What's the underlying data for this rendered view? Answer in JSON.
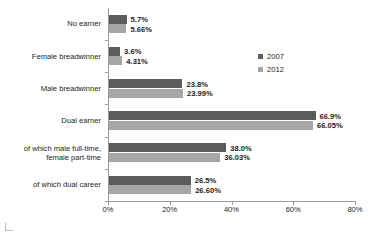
{
  "chart_data": {
    "type": "bar",
    "orientation": "horizontal",
    "title": "",
    "xlabel": "",
    "ylabel": "",
    "xlim": [
      0,
      80
    ],
    "xticks": [
      "0%",
      "20%",
      "40%",
      "60%",
      "80%"
    ],
    "xtick_values": [
      0,
      20,
      40,
      60,
      80
    ],
    "grid": false,
    "legend_position": "right",
    "categories": [
      "No earner",
      "Female breadwinner",
      "Male breadwinner",
      "Dual earner",
      "of which male full-time,\nfemale part-time",
      "of which dual career"
    ],
    "series": [
      {
        "name": "2007",
        "color": "#5c5c5c",
        "values": [
          5.7,
          3.6,
          23.8,
          66.9,
          38.0,
          26.5
        ],
        "labels": [
          "5.7%",
          "3.6%",
          "23.8%",
          "66.9%",
          "38.0%",
          "26.5%"
        ]
      },
      {
        "name": "2012",
        "color": "#a6a6a6",
        "values": [
          5.66,
          4.31,
          23.99,
          66.05,
          36.03,
          26.6
        ],
        "labels": [
          "5.66%",
          "4.31%",
          "23.99%",
          "66.05%",
          "36.03%",
          "26.60%"
        ]
      }
    ]
  }
}
